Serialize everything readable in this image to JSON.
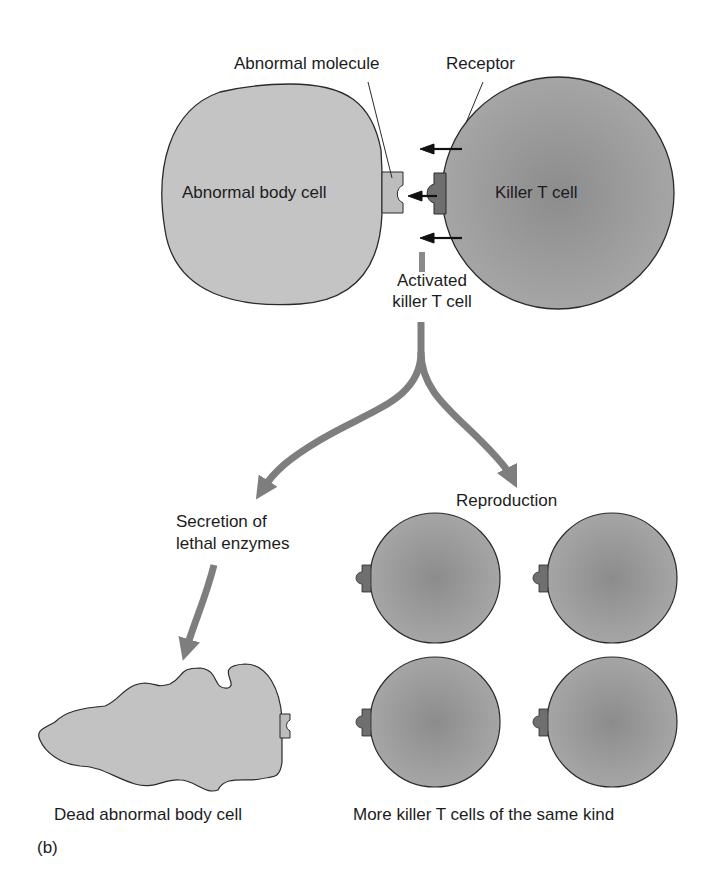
{
  "diagram": {
    "panel_label": "(b)",
    "top": {
      "abnormal_molecule_label": "Abnormal molecule",
      "receptor_label": "Receptor",
      "abnormal_cell_label": "Abnormal body cell",
      "killer_cell_label": "Killer T cell",
      "activated_label_line1": "Activated",
      "activated_label_line2": "killer T cell"
    },
    "branches": {
      "left_label_line1": "Secretion of",
      "left_label_line2": "lethal enzymes",
      "right_label": "Reproduction"
    },
    "bottom": {
      "dead_cell_label": "Dead abnormal body cell",
      "more_cells_label": "More killer T cells of the same kind",
      "clone_count": 4
    },
    "colors": {
      "abnormal_cell_fill": "#c4c4c4",
      "killer_cell_fill": "#9a9a9a",
      "killer_cell_center": "#8a8a8a",
      "molecule_fill": "#bdbdbd",
      "receptor_fill": "#6f6f6f",
      "flow_arrow": "#7e7e7e",
      "outline": "#2a2a2a"
    }
  }
}
